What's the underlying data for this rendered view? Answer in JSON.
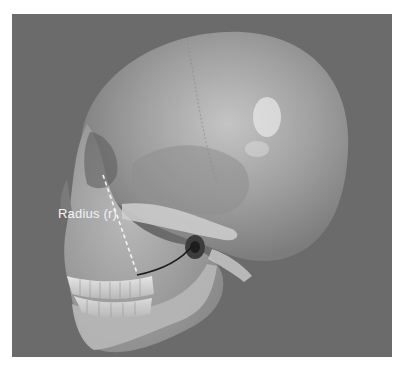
{
  "figure": {
    "background_color": "#6b6b6b",
    "annotation": {
      "label": "Radius (r)",
      "line_style": "dashed",
      "arc_style": "solid"
    }
  }
}
